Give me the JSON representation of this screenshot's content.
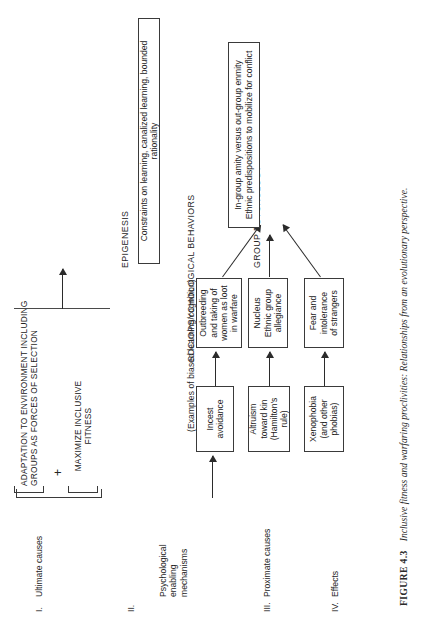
{
  "figure": {
    "caption_label": "FIGURE 4.3",
    "caption_text": "Inclusive fitness and warfaring proclivities: Relationships from an evolutionary perspective."
  },
  "row_labels": [
    {
      "numeral": "I.",
      "text": "Ultimate causes"
    },
    {
      "numeral": "II.",
      "text": "Psychological\nenabling\nmechanisms"
    },
    {
      "numeral": "III.",
      "text": "Proximate causes"
    },
    {
      "numeral": "IV.",
      "text": "Effects"
    }
  ],
  "stage_headings": {
    "epigenesis": "EPIGENESIS",
    "examples": "(Examples of biased learning/cognition)",
    "sociopsychological": "SOCIOPSYCHOLOGICAL BEHAVIORS",
    "group_psychology": "GROUP PSYCHOLOGY"
  },
  "ultimate_causes": {
    "top_box": "ADAPTATION TO ENVIRONMENT INCLUDING\nGROUPS AS FORCES OF SELECTION",
    "operator": "+",
    "bottom_box": "MAXIMIZE INCLUSIVE\nFITNESS"
  },
  "epigenesis_box": "Constraints on learning, canalized learning, bounded rationality",
  "proximate_boxes": [
    {
      "id": "incest",
      "text": "Incest\navoidance"
    },
    {
      "id": "altruism",
      "text": "Altruism\ntoward kin\n(Hamilton's\nrule)"
    },
    {
      "id": "xenophobia",
      "text": "Xenophobia\n(and other\nphobias)"
    }
  ],
  "behavior_boxes": [
    {
      "id": "outbreeding",
      "text": "Outbreeding\nand taking of\nwomen as loot\nin warfare"
    },
    {
      "id": "nucleus",
      "text": "Nucleus\nEthnic group\nallegiance"
    },
    {
      "id": "fear",
      "text": "Fear and\nintolerance\nof strangers"
    }
  ],
  "effects_box": "In-group amity versus out-group enmity\nEthnic predispositions to mobilize for conflict",
  "colors": {
    "ink": "#222222",
    "rule": "#3a3a3a",
    "background": "#ffffff"
  }
}
